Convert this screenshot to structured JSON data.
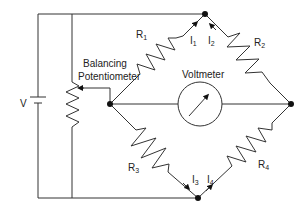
{
  "diagram": {
    "type": "wheatstone-bridge-circuit",
    "background": "#ffffff",
    "line_color": "#333333",
    "labels": {
      "source": "V",
      "potentiometer_line1": "Balancing",
      "potentiometer_line2": "Potentiometer",
      "meter": "Voltmeter"
    },
    "resistors": [
      {
        "id": "R1",
        "main": "R",
        "sub": "1"
      },
      {
        "id": "R2",
        "main": "R",
        "sub": "2"
      },
      {
        "id": "R3",
        "main": "R",
        "sub": "3"
      },
      {
        "id": "R4",
        "main": "R",
        "sub": "4"
      }
    ],
    "currents": [
      {
        "id": "I1",
        "main": "I",
        "sub": "1"
      },
      {
        "id": "I2",
        "main": "I",
        "sub": "2"
      },
      {
        "id": "I3",
        "main": "I",
        "sub": "3"
      },
      {
        "id": "I4",
        "main": "I",
        "sub": "4"
      }
    ],
    "nodes": [
      "top",
      "left",
      "right",
      "bottom"
    ]
  }
}
